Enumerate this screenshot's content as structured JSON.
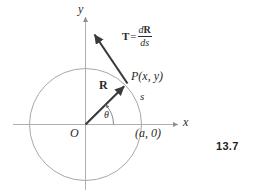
{
  "figure": {
    "number_label": "13.7",
    "axes": {
      "x_label": "x",
      "y_label": "y",
      "origin_label": "O"
    },
    "circle": {
      "center_x": 85.5,
      "center_y": 124.5,
      "radius": 56,
      "stroke_color": "#a8a8a8"
    },
    "point": {
      "label": "P(x, y)",
      "x": 126,
      "y": 84.5
    },
    "intercept": {
      "label": "(a, 0)"
    },
    "arc_length": {
      "label": "s"
    },
    "angle": {
      "label": "θ"
    },
    "position_vector": {
      "label": "R"
    },
    "tangent_vector": {
      "label": "T",
      "equals": "=",
      "numerator_d": "d",
      "numerator_vec": "R",
      "denominator": "ds"
    },
    "colors": {
      "axis": "#b0b0b0",
      "circle": "#a8a8a8",
      "vector": "#3a3a3a",
      "text": "#2b2b2b",
      "figure_number": "#231f20",
      "background": "#ffffff"
    }
  }
}
